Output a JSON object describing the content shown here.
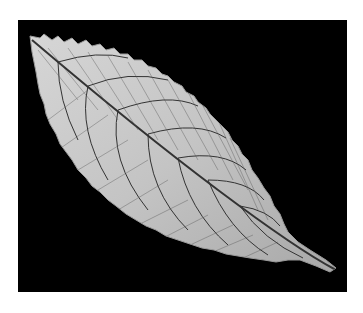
{
  "image": {
    "subject": "leaf skeleton",
    "alt": "Black and white photograph of a serrated leaf showing its vein network on a black background",
    "background_color": "#000000",
    "page_background": "#ffffff",
    "leaf_color": "#c8c8c8",
    "vein_color": "#3a3a3a"
  }
}
